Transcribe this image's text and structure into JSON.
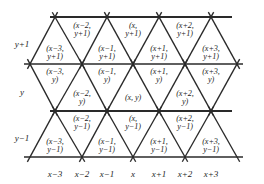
{
  "figure": {
    "type": "triangular-lattice-diagram",
    "ink_color": "#1d1d1d",
    "line_color": "#2a2a2a",
    "background": "#ffffff"
  },
  "geometry": {
    "rows": [
      {
        "y": 17,
        "nodes_x": [
          55,
          107,
          159,
          211
        ],
        "line_from": 50,
        "line_to": 232
      },
      {
        "y": 64,
        "nodes_x": [
          30,
          82,
          133,
          185,
          237
        ],
        "line_from": 24,
        "line_to": 243
      },
      {
        "y": 111,
        "nodes_x": [
          55,
          107,
          159,
          211
        ],
        "line_from": 50,
        "line_to": 232
      },
      {
        "y": 157,
        "nodes_x": [
          30,
          82,
          133,
          185,
          237
        ],
        "line_from": 24,
        "line_to": 243
      }
    ],
    "node_mark": "X",
    "spacing_x": 51.5,
    "spacing_y": 46.8
  },
  "axes": {
    "x_labels": [
      {
        "text": "x−3",
        "x": 55
      },
      {
        "text": "x−2",
        "x": 82
      },
      {
        "text": "x−1",
        "x": 107
      },
      {
        "text": "x",
        "x": 133
      },
      {
        "text": "x+1",
        "x": 159
      },
      {
        "text": "x+2",
        "x": 185
      },
      {
        "text": "x+3",
        "x": 211
      }
    ],
    "x_labels_y": 170,
    "y_labels": [
      {
        "text": "y+1",
        "y": 40
      },
      {
        "text": "y",
        "y": 88
      },
      {
        "text": "y−1",
        "y": 134
      }
    ],
    "y_labels_x": 22
  },
  "cell_labels": [
    {
      "line1": "(x−2,",
      "line2": "y+1)",
      "x": 82,
      "y": 22
    },
    {
      "line1": "(x,",
      "line2": "y+1)",
      "x": 133,
      "y": 22
    },
    {
      "line1": "(x+2,",
      "line2": "y+1)",
      "x": 185,
      "y": 22
    },
    {
      "line1": "(x−3,",
      "line2": "y+1)",
      "x": 55,
      "y": 45
    },
    {
      "line1": "(x−1,",
      "line2": "y+1)",
      "x": 107,
      "y": 45
    },
    {
      "line1": "(x+1,",
      "line2": "y+1)",
      "x": 159,
      "y": 45
    },
    {
      "line1": "(x+3,",
      "line2": "y+1)",
      "x": 211,
      "y": 45
    },
    {
      "line1": "(x−3,",
      "line2": "y)",
      "x": 55,
      "y": 68
    },
    {
      "line1": "(x−1,",
      "line2": "y)",
      "x": 107,
      "y": 68
    },
    {
      "line1": "(x+1,",
      "line2": "y)",
      "x": 159,
      "y": 68
    },
    {
      "line1": "(x+3,",
      "line2": "y)",
      "x": 211,
      "y": 68
    },
    {
      "line1": "(x−2,",
      "line2": "y)",
      "x": 82,
      "y": 90
    },
    {
      "line1": "(x, y)",
      "line2": "",
      "x": 133,
      "y": 94
    },
    {
      "line1": "(x+2,",
      "line2": "y)",
      "x": 185,
      "y": 90
    },
    {
      "line1": "(x−2,",
      "line2": "y−1)",
      "x": 82,
      "y": 115
    },
    {
      "line1": "(x,",
      "line2": "y−1)",
      "x": 133,
      "y": 115
    },
    {
      "line1": "(x+2,",
      "line2": "y−1)",
      "x": 185,
      "y": 115
    },
    {
      "line1": "(x−3,",
      "line2": "y−1)",
      "x": 55,
      "y": 138
    },
    {
      "line1": "(x−1,",
      "line2": "y−1)",
      "x": 107,
      "y": 138
    },
    {
      "line1": "(x+1,",
      "line2": "y−1)",
      "x": 159,
      "y": 138
    },
    {
      "line1": "(x+3,",
      "line2": "y−1)",
      "x": 211,
      "y": 138
    }
  ]
}
